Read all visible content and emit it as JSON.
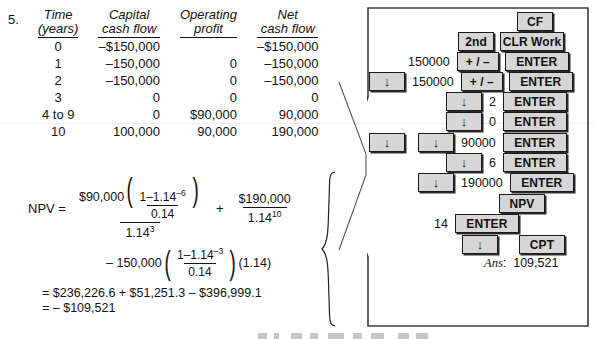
{
  "problem": {
    "number": "5."
  },
  "table": {
    "headers": [
      {
        "line1": "Time",
        "line2": "(years)"
      },
      {
        "line1": "Capital",
        "line2": "cash flow"
      },
      {
        "line1": "Operating",
        "line2": "profit"
      },
      {
        "line1": "Net",
        "line2": "cash flow"
      }
    ],
    "rows": [
      {
        "time": "0",
        "capital": "–$150,000",
        "operating": "",
        "net": "–$150,000"
      },
      {
        "time": "1",
        "capital": "–150,000",
        "operating": "0",
        "net": "–150,000"
      },
      {
        "time": "2",
        "capital": "–150,000",
        "operating": "0",
        "net": "–150,000"
      },
      {
        "time": "3",
        "capital": "0",
        "operating": "0",
        "net": "0"
      },
      {
        "time": "4 to 9",
        "capital": "0",
        "operating": "$90,000",
        "net": "90,000"
      },
      {
        "time": "10",
        "capital": "100,000",
        "operating": "90,000",
        "net": "190,000"
      }
    ]
  },
  "formula": {
    "label": "NPV =",
    "term1": {
      "coefficient": "$90,000",
      "inner_numerator_a": "1",
      "inner_minus": "–",
      "inner_numerator_b": "1.14",
      "inner_numerator_exp": "–6",
      "inner_denominator": "0.14",
      "denominator_base": "1.14",
      "denominator_exp": "3"
    },
    "operator1": "+",
    "term2": {
      "numerator": "$190,000",
      "denominator_base": "1.14",
      "denominator_exp": "10"
    },
    "term3": {
      "leading": "– 150,000",
      "inner_numerator_a": "1",
      "inner_minus": "–",
      "inner_numerator_b": "1.14",
      "inner_numerator_exp": "–3",
      "inner_denominator": "0.14",
      "trailing": "(1.14)"
    },
    "result_line1": "= $236,226.6 + $51,251.3 – $396,999.1",
    "result_line2": "= – $109,521"
  },
  "calculator": {
    "keystrokes": [
      {
        "row": 0,
        "entry": "",
        "keys": [
          "CF"
        ]
      },
      {
        "row": 1,
        "entry": "",
        "keys": [
          "2nd",
          "CLR Work"
        ]
      },
      {
        "row": 2,
        "entry": "150000",
        "keys": [
          "+ / –",
          "ENTER"
        ]
      },
      {
        "row": 3,
        "entry": "150000",
        "keys": [
          "↓",
          "+ / –",
          "ENTER"
        ]
      },
      {
        "row": 4,
        "entry": "2",
        "keys": [
          "↓",
          "ENTER"
        ]
      },
      {
        "row": 5,
        "entry": "0",
        "keys": [
          "↓",
          "ENTER"
        ]
      },
      {
        "row": 6,
        "entry": "90000",
        "keys": [
          "↓",
          "↓",
          "ENTER"
        ]
      },
      {
        "row": 7,
        "entry": "6",
        "keys": [
          "↓",
          "ENTER"
        ]
      },
      {
        "row": 8,
        "entry": "190000",
        "keys": [
          "↓",
          "ENTER"
        ]
      },
      {
        "row": 9,
        "entry": "",
        "keys": [
          "NPV"
        ]
      },
      {
        "row": 10,
        "entry": "14",
        "keys": [
          "ENTER"
        ]
      },
      {
        "row": 11,
        "entry": "",
        "keys": [
          "↓",
          "CPT"
        ]
      }
    ],
    "labels": {
      "cf": "CF",
      "second": "2nd",
      "clr_work": "CLR Work",
      "plus_minus": "+ / –",
      "enter": "ENTER",
      "down_arrow": "↓",
      "npv": "NPV",
      "cpt": "CPT"
    },
    "entries": {
      "e1": "150000",
      "e2": "150000",
      "e3": "2",
      "e4": "0",
      "e5": "90000",
      "e6": "6",
      "e7": "190000",
      "e8": "14"
    },
    "answer_label": "Ans",
    "answer_colon": ":",
    "answer_value": "109,521"
  },
  "colors": {
    "key_face": "#d6d6d6",
    "key_border": "#1a1a1a",
    "panel_border": "#3a3a3a",
    "text": "#111111"
  }
}
